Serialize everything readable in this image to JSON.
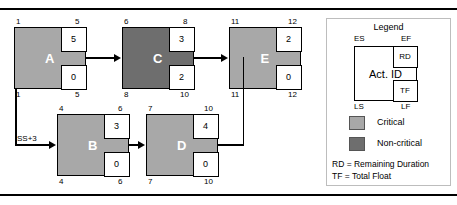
{
  "figure": {
    "type": "precedence-network-diagram",
    "rules": [
      "top-rule",
      "bottom-rule"
    ]
  },
  "nodes": [
    {
      "id": "A",
      "label": "A",
      "es": "1",
      "ef": "5",
      "ls": "1",
      "lf": "5",
      "rd": "5",
      "tf": "0",
      "status": "Critical",
      "fill": "#a8a8a8"
    },
    {
      "id": "C",
      "label": "C",
      "es": "6",
      "ef": "8",
      "ls": "8",
      "lf": "10",
      "rd": "3",
      "tf": "2",
      "status": "Non-critical",
      "fill": "#6e6e6e"
    },
    {
      "id": "E",
      "label": "E",
      "es": "11",
      "ef": "12",
      "ls": "11",
      "lf": "12",
      "rd": "2",
      "tf": "0",
      "status": "Critical",
      "fill": "#a8a8a8"
    },
    {
      "id": "B",
      "label": "B",
      "es": "4",
      "ef": "6",
      "ls": "4",
      "lf": "6",
      "rd": "3",
      "tf": "0",
      "status": "Critical",
      "fill": "#a8a8a8"
    },
    {
      "id": "D",
      "label": "D",
      "es": "7",
      "ef": "10",
      "ls": "7",
      "lf": "10",
      "rd": "4",
      "tf": "0",
      "status": "Critical",
      "fill": "#a8a8a8"
    }
  ],
  "links": [
    {
      "from": "A",
      "to": "C",
      "lag_label": ""
    },
    {
      "from": "C",
      "to": "E",
      "lag_label": ""
    },
    {
      "from": "A",
      "to": "B",
      "lag_label": "SS+3"
    },
    {
      "from": "B",
      "to": "D",
      "lag_label": ""
    },
    {
      "from": "D",
      "to": "E",
      "lag_label": ""
    }
  ],
  "legend": {
    "title": "Legend",
    "corners": {
      "es": "ES",
      "ef": "EF",
      "ls": "LS",
      "lf": "LF"
    },
    "node": {
      "act_id": "Act. ID",
      "rd": "RD",
      "tf": "TF"
    },
    "swatches": [
      {
        "label": "Critical",
        "color": "#a8a8a8"
      },
      {
        "label": "Non-critical",
        "color": "#6e6e6e"
      }
    ],
    "footnotes": [
      "RD = Remaining Duration",
      "TF = Total Float"
    ]
  }
}
